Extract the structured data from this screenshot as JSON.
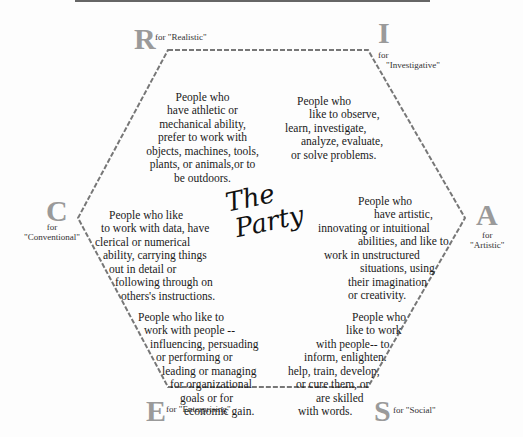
{
  "title": {
    "line1": "The",
    "line2": "Party"
  },
  "types": {
    "R": {
      "letter": "R",
      "for": "for \"Realistic\"",
      "lines": [
        "People who",
        "have athletic or",
        "mechanical ability,",
        "prefer to work with",
        "objects, machines, tools,",
        "plants, or animals,or to",
        "be outdoors."
      ]
    },
    "I": {
      "letter": "I",
      "for1": "for",
      "for2": "\"Investigative\"",
      "lines": [
        "People who",
        "like to observe,",
        "learn, investigate,",
        "analyze, evaluate,",
        "or solve problems."
      ]
    },
    "A": {
      "letter": "A",
      "for1": "for",
      "for2": "\"Artistic\"",
      "lines": [
        "People who",
        "have artistic,",
        "innovating or intuitional",
        "abilities, and like to",
        "work in unstructured",
        "situations, using",
        "their imagination",
        "or creativity."
      ]
    },
    "S": {
      "letter": "S",
      "for": "for \"Social\"",
      "lines": [
        "People who",
        "like to work",
        "with people-- to",
        "inform, enlighten.",
        "help, train, develop,",
        "or cure them, or",
        "are skilled",
        "with words."
      ]
    },
    "E": {
      "letter": "E",
      "for": "for \"Enterprising\"",
      "lines": [
        "People who like to",
        "work with people --",
        "influencing, persuading",
        "or performing or",
        "leading or managing",
        "for organizational",
        "goals or for",
        "economic gain."
      ]
    },
    "C": {
      "letter": "C",
      "for1": "for",
      "for2": "\"Conventional\"",
      "lines": [
        "People who like",
        "to work with data, have",
        "clerical or numerical",
        "ability, carrying things",
        "out in detail or",
        "following through on",
        "others's instructions."
      ]
    }
  }
}
